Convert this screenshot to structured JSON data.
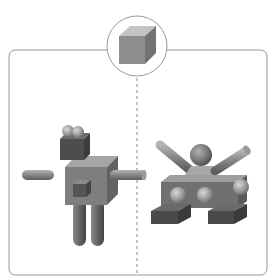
{
  "figure": {
    "reference": {
      "shape": "cube",
      "label": ""
    },
    "panels": [
      {
        "id": "left",
        "figure": "robot",
        "parts": [
          "two spheres on head",
          "cube head",
          "cube body",
          "small cube on body",
          "two cylinder arms",
          "two cylinder legs"
        ]
      },
      {
        "id": "right",
        "figure": "tank-like creature",
        "parts": [
          "sphere head",
          "trapezoid base",
          "two cylinder arms",
          "box body",
          "three sphere studs",
          "two box feet"
        ]
      }
    ],
    "colors": {
      "frame": "#9a9a9a",
      "divider": "#8a8a8a",
      "cube_top": "#c8c8c8",
      "cube_front": "#8e8e8e",
      "cube_side": "#767676",
      "dark_top": "#7a7a7a",
      "dark_front": "#555555",
      "dark_side": "#444444",
      "mid_front": "#777777",
      "mid_top": "#9a9a9a",
      "mid_side": "#5f5f5f",
      "sphere": "#a8a8a8"
    }
  }
}
